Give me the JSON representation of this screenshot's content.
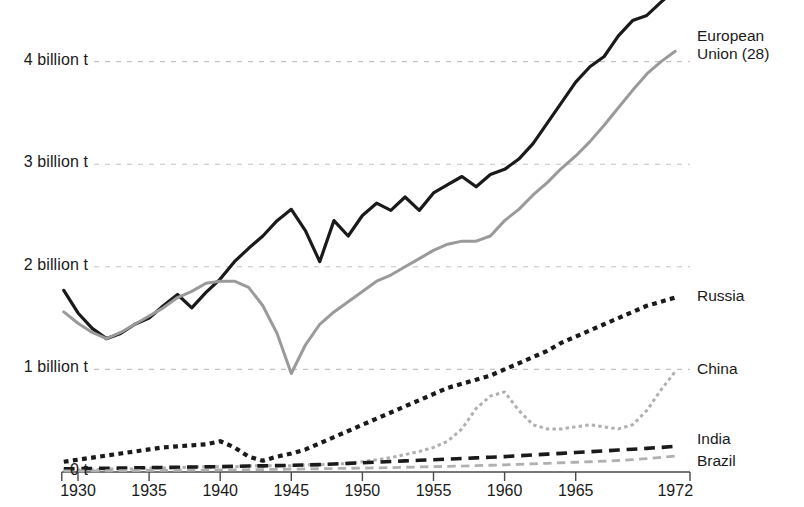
{
  "chart_data": {
    "type": "line",
    "title": "",
    "subtitle": "",
    "xlabel": "",
    "ylabel": "",
    "xlim": [
      1929,
      1972
    ],
    "ylim": [
      0,
      4.75
    ],
    "grid": "horizontal dashed gridlines at 1, 2, 3 and 4 billion t",
    "legend_position": "right, inline at end of each line",
    "y_tick_labels": [
      "0 t",
      "1 billion t",
      "2 billion t",
      "3 billion t",
      "4 billion t"
    ],
    "y_tick_values": [
      0,
      1,
      2,
      3,
      4
    ],
    "x_tick_labels": [
      "1930",
      "1935",
      "1940",
      "1945",
      "1950",
      "1955",
      "1960",
      "1965",
      "1972"
    ],
    "x_tick_values": [
      1930,
      1935,
      1940,
      1945,
      1950,
      1955,
      1960,
      1965,
      1972
    ],
    "units": "billion t",
    "x": [
      1929,
      1930,
      1931,
      1932,
      1933,
      1934,
      1935,
      1936,
      1937,
      1938,
      1939,
      1940,
      1941,
      1942,
      1943,
      1944,
      1945,
      1946,
      1947,
      1948,
      1949,
      1950,
      1951,
      1952,
      1953,
      1954,
      1955,
      1956,
      1957,
      1958,
      1959,
      1960,
      1961,
      1962,
      1963,
      1964,
      1965,
      1966,
      1967,
      1968,
      1969,
      1970,
      1971,
      1972
    ],
    "series": [
      {
        "name": "United States",
        "color": "#1a1a1a",
        "style": "solid",
        "width": 3.2,
        "label_at": 1972,
        "values": [
          1.77,
          1.55,
          1.4,
          1.3,
          1.35,
          1.44,
          1.5,
          1.62,
          1.73,
          1.6,
          1.75,
          1.88,
          2.05,
          2.18,
          2.3,
          2.45,
          2.56,
          2.35,
          2.05,
          2.45,
          2.3,
          2.5,
          2.62,
          2.55,
          2.68,
          2.55,
          2.72,
          2.8,
          2.88,
          2.78,
          2.9,
          2.95,
          3.05,
          3.2,
          3.4,
          3.6,
          3.8,
          3.95,
          4.05,
          4.25,
          4.4,
          4.45,
          4.58,
          4.7
        ]
      },
      {
        "name": "European Union (28)",
        "color": "#9a9a9a",
        "style": "solid",
        "width": 3.0,
        "label_at": 1972,
        "values": [
          1.56,
          1.45,
          1.36,
          1.3,
          1.36,
          1.44,
          1.52,
          1.6,
          1.7,
          1.76,
          1.84,
          1.86,
          1.86,
          1.8,
          1.62,
          1.35,
          0.96,
          1.24,
          1.44,
          1.56,
          1.66,
          1.76,
          1.86,
          1.92,
          2.0,
          2.08,
          2.16,
          2.22,
          2.25,
          2.25,
          2.3,
          2.45,
          2.56,
          2.7,
          2.82,
          2.96,
          3.08,
          3.22,
          3.38,
          3.55,
          3.72,
          3.88,
          4.0,
          4.1
        ]
      },
      {
        "name": "Russia",
        "color": "#1a1a1a",
        "style": "dotted",
        "width": 4.2,
        "label_at": 1972,
        "values": [
          0.1,
          0.12,
          0.14,
          0.16,
          0.18,
          0.2,
          0.22,
          0.24,
          0.25,
          0.26,
          0.27,
          0.3,
          0.24,
          0.15,
          0.11,
          0.15,
          0.18,
          0.22,
          0.28,
          0.34,
          0.4,
          0.46,
          0.52,
          0.58,
          0.64,
          0.7,
          0.76,
          0.82,
          0.86,
          0.9,
          0.94,
          1.0,
          1.06,
          1.12,
          1.18,
          1.26,
          1.32,
          1.38,
          1.44,
          1.5,
          1.56,
          1.62,
          1.66,
          1.7
        ]
      },
      {
        "name": "China",
        "color": "#b0b0b0",
        "style": "dotted",
        "width": 3.0,
        "label_at": 1972,
        "values": [
          0.02,
          0.02,
          0.02,
          0.03,
          0.03,
          0.03,
          0.04,
          0.04,
          0.04,
          0.05,
          0.05,
          0.05,
          0.05,
          0.06,
          0.06,
          0.06,
          0.06,
          0.07,
          0.07,
          0.08,
          0.08,
          0.1,
          0.12,
          0.14,
          0.17,
          0.2,
          0.24,
          0.3,
          0.42,
          0.62,
          0.74,
          0.78,
          0.6,
          0.46,
          0.42,
          0.42,
          0.44,
          0.46,
          0.44,
          0.42,
          0.46,
          0.6,
          0.8,
          0.98
        ]
      },
      {
        "name": "India",
        "color": "#1a1a1a",
        "style": "dashed",
        "width": 3.6,
        "label_at": 1972,
        "values": [
          0.03,
          0.032,
          0.034,
          0.036,
          0.038,
          0.04,
          0.042,
          0.044,
          0.046,
          0.048,
          0.05,
          0.052,
          0.055,
          0.058,
          0.06,
          0.062,
          0.065,
          0.068,
          0.072,
          0.078,
          0.084,
          0.09,
          0.096,
          0.102,
          0.108,
          0.114,
          0.12,
          0.126,
          0.132,
          0.138,
          0.144,
          0.15,
          0.158,
          0.166,
          0.174,
          0.182,
          0.19,
          0.198,
          0.206,
          0.214,
          0.222,
          0.23,
          0.24,
          0.25
        ]
      },
      {
        "name": "Brazil",
        "color": "#b0b0b0",
        "style": "dashed",
        "width": 2.8,
        "label_at": 1972,
        "values": [
          0.01,
          0.01,
          0.011,
          0.012,
          0.013,
          0.014,
          0.015,
          0.016,
          0.017,
          0.018,
          0.019,
          0.02,
          0.021,
          0.022,
          0.024,
          0.026,
          0.028,
          0.03,
          0.032,
          0.034,
          0.036,
          0.038,
          0.04,
          0.043,
          0.046,
          0.049,
          0.052,
          0.055,
          0.058,
          0.062,
          0.066,
          0.07,
          0.075,
          0.08,
          0.085,
          0.09,
          0.095,
          0.1,
          0.106,
          0.112,
          0.12,
          0.13,
          0.142,
          0.155
        ]
      }
    ]
  }
}
